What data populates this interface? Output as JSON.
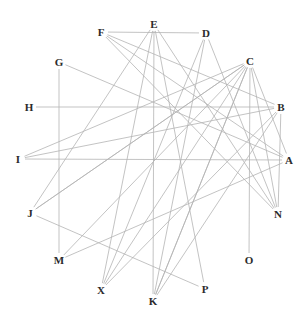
{
  "figure": {
    "type": "graph-diagram",
    "title": "",
    "background_color": "#ffffff",
    "width": 306,
    "height": 318
  },
  "style": {
    "edge_color": "#b4b4b4",
    "edge_width": 0.8,
    "label_color": "#2b2b2b",
    "label_font_size": 11,
    "node_marker": "none"
  },
  "chart_data": {
    "type": "graph",
    "layout": "circular",
    "node_count": 16,
    "edge_count": 32,
    "nodes": [
      {
        "id": "A",
        "label": "A",
        "x": 289,
        "y": 160
      },
      {
        "id": "B",
        "label": "B",
        "x": 281,
        "y": 107
      },
      {
        "id": "C",
        "label": "C",
        "x": 250,
        "y": 61
      },
      {
        "id": "D",
        "label": "D",
        "x": 206,
        "y": 33
      },
      {
        "id": "E",
        "label": "E",
        "x": 154,
        "y": 24
      },
      {
        "id": "F",
        "label": "F",
        "x": 101,
        "y": 32
      },
      {
        "id": "G",
        "label": "G",
        "x": 59,
        "y": 62
      },
      {
        "id": "H",
        "label": "H",
        "x": 29,
        "y": 107
      },
      {
        "id": "I",
        "label": "I",
        "x": 18,
        "y": 159
      },
      {
        "id": "J",
        "label": "J",
        "x": 30,
        "y": 213
      },
      {
        "id": "M",
        "label": "M",
        "x": 59,
        "y": 260
      },
      {
        "id": "X",
        "label": "X",
        "x": 101,
        "y": 290
      },
      {
        "id": "K",
        "label": "K",
        "x": 153,
        "y": 301
      },
      {
        "id": "P",
        "label": "P",
        "x": 205,
        "y": 289
      },
      {
        "id": "O",
        "label": "O",
        "x": 249,
        "y": 260
      },
      {
        "id": "N",
        "label": "N",
        "x": 278,
        "y": 214
      }
    ],
    "edges": [
      {
        "source": "F",
        "target": "D"
      },
      {
        "source": "F",
        "target": "N"
      },
      {
        "source": "F",
        "target": "A"
      },
      {
        "source": "F",
        "target": "B"
      },
      {
        "source": "E",
        "target": "K"
      },
      {
        "source": "E",
        "target": "X"
      },
      {
        "source": "E",
        "target": "P"
      },
      {
        "source": "E",
        "target": "N"
      },
      {
        "source": "D",
        "target": "K"
      },
      {
        "source": "D",
        "target": "X"
      },
      {
        "source": "D",
        "target": "N"
      },
      {
        "source": "C",
        "target": "O"
      },
      {
        "source": "C",
        "target": "K"
      },
      {
        "source": "C",
        "target": "X"
      },
      {
        "source": "C",
        "target": "J"
      },
      {
        "source": "C",
        "target": "M"
      },
      {
        "source": "C",
        "target": "I"
      },
      {
        "source": "C",
        "target": "N"
      },
      {
        "source": "C",
        "target": "A"
      },
      {
        "source": "G",
        "target": "M"
      },
      {
        "source": "G",
        "target": "A"
      },
      {
        "source": "H",
        "target": "B"
      },
      {
        "source": "I",
        "target": "B"
      },
      {
        "source": "I",
        "target": "A"
      },
      {
        "source": "J",
        "target": "E"
      },
      {
        "source": "J",
        "target": "C"
      },
      {
        "source": "J",
        "target": "P"
      },
      {
        "source": "M",
        "target": "A"
      },
      {
        "source": "X",
        "target": "B"
      },
      {
        "source": "K",
        "target": "B"
      },
      {
        "source": "K",
        "target": "C"
      },
      {
        "source": "N",
        "target": "B"
      }
    ],
    "xlabel": "",
    "ylabel": "",
    "legend": []
  }
}
